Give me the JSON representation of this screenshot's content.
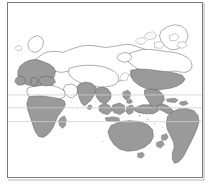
{
  "figure": {
    "type": "world-map",
    "title": "",
    "projection": "pacific-centered-equirectangular",
    "background_color": "#ffffff",
    "frame": {
      "border_color": "#7b7b7b",
      "border_width_px": 1,
      "left_px": 7,
      "top_px": 2,
      "width_px": 196,
      "height_px": 176
    }
  },
  "map": {
    "land_outline_color": "#595959",
    "highlight_fill_color": "#9a9a9a",
    "unhighlighted_fill_color": "#ffffff",
    "ocean_color": "#ffffff",
    "graticule": {
      "visible": true,
      "color": "#cfcfcf",
      "lines": [
        {
          "name": "tropic-of-cancer",
          "label": "",
          "y_px": 95
        },
        {
          "name": "equator",
          "label": "",
          "y_px": 108
        },
        {
          "name": "tropic-of-capricorn",
          "label": "",
          "y_px": 122
        }
      ]
    },
    "highlighted_regions": [
      "Europe",
      "Sub-Saharan Africa",
      "India",
      "Southeast Asia",
      "Indonesia",
      "New Guinea",
      "Australia",
      "New Zealand",
      "United States",
      "Mexico",
      "Central America",
      "Caribbean",
      "South America"
    ],
    "unhighlighted_regions": [
      "Russia",
      "Siberia",
      "Central Asia",
      "China",
      "Mongolia",
      "Sahara",
      "Arabian Peninsula",
      "Canada",
      "Greenland",
      "Arctic Islands",
      "Iceland"
    ]
  },
  "chart_data": {
    "type": "map",
    "title": "",
    "xlabel": "",
    "ylabel": "",
    "legend": [],
    "categories": [
      "highlighted",
      "not-highlighted"
    ],
    "values": [
      13,
      11
    ]
  }
}
